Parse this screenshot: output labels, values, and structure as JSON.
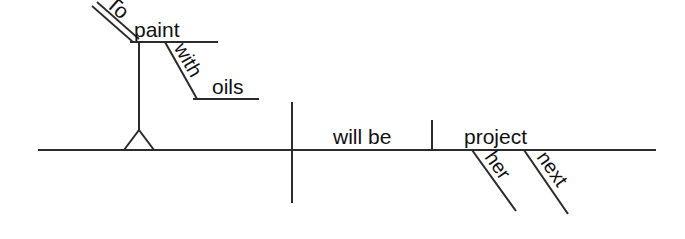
{
  "diagram": {
    "type": "reed-kellogg-sentence-diagram",
    "sentence": "To paint with oils will be her next project.",
    "ink_color": "#2b2b2b",
    "text_color": "#111111",
    "background_color": "#ffffff",
    "words": {
      "infinitive_marker": "To",
      "infinitive_verb": "paint",
      "preposition": "with",
      "prepositional_object": "oils",
      "verb": "will be",
      "predicate_nominative": "project",
      "modifier_possessive": "her",
      "modifier_adjective": "next"
    },
    "labels": {
      "subject_slot": "To paint with oils",
      "verb_slot": "will be",
      "complement_slot": "project"
    }
  }
}
